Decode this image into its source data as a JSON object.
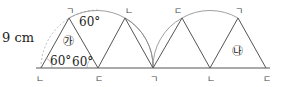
{
  "diagram": {
    "side_label": "9 cm",
    "angle_labels": [
      "60°",
      "60°",
      "60°"
    ],
    "region_labels": {
      "first": "㉮",
      "second": "㉯"
    },
    "vertex_labels": {
      "top": [
        "ㄱ",
        "ㄴ",
        "ㄷ",
        "ㄱ"
      ],
      "bottom": [
        "ㄴ",
        "ㄷ",
        "ㄱ",
        "ㄴ",
        "ㄷ"
      ]
    },
    "colors": {
      "line": "#555555",
      "arc": "#888888",
      "dashed_arc": "#aaaaaa"
    }
  }
}
